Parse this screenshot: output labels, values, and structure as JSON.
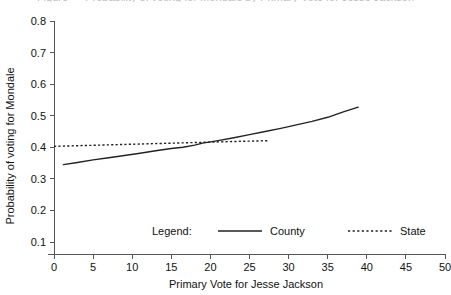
{
  "figure": {
    "clipped_title": "Figure — Probability of voting for Mondale by Primary Vote for Jesse Jackson"
  },
  "chart_data": {
    "type": "line",
    "title": "",
    "xlabel": "Primary Vote for Jesse Jackson",
    "ylabel": "Probability of voting for Mondale",
    "xlim": [
      0,
      50
    ],
    "ylim": [
      0.1,
      0.8
    ],
    "xticks": [
      0,
      5,
      10,
      15,
      20,
      25,
      30,
      35,
      40,
      45,
      50
    ],
    "xtick_labels": [
      "0",
      "5",
      "10",
      "15",
      "20",
      "25",
      "30",
      "35",
      "40",
      "45",
      "50"
    ],
    "yticks": [
      0.1,
      0.2,
      0.3,
      0.4,
      0.5,
      0.6,
      0.7,
      0.8
    ],
    "ytick_labels": [
      "0.1",
      "0.2",
      "0.3",
      "0.4",
      "0.5",
      "0.6",
      "0.7",
      "0.8"
    ],
    "grid": false,
    "legend_position": "inside-bottom-center",
    "legend_title": "Legend:",
    "series": [
      {
        "name": "County",
        "style": "solid",
        "color": "#222222",
        "x": [
          1.2,
          3.0,
          5.0,
          7.0,
          9.0,
          11.0,
          13.0,
          15.0,
          16.5,
          18.0,
          19.0,
          21.0,
          23.0,
          25.0,
          27.0,
          29.0,
          31.0,
          33.0,
          35.0,
          37.0,
          38.9
        ],
        "y": [
          0.345,
          0.352,
          0.36,
          0.367,
          0.374,
          0.381,
          0.389,
          0.396,
          0.4,
          0.407,
          0.413,
          0.421,
          0.43,
          0.44,
          0.45,
          0.46,
          0.471,
          0.482,
          0.495,
          0.512,
          0.527
        ]
      },
      {
        "name": "State",
        "style": "dotted",
        "color": "#222222",
        "x": [
          0.0,
          3.0,
          6.0,
          9.0,
          12.0,
          15.0,
          18.0,
          21.0,
          24.0,
          26.0,
          27.5
        ],
        "y": [
          0.403,
          0.405,
          0.407,
          0.409,
          0.411,
          0.413,
          0.415,
          0.417,
          0.419,
          0.42,
          0.421
        ]
      }
    ]
  }
}
